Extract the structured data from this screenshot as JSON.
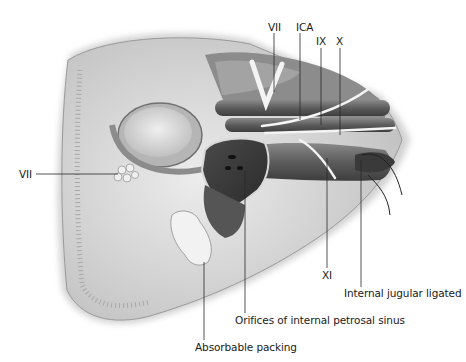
{
  "figure": {
    "type": "anatomical-illustration",
    "labels": [
      {
        "id": "vii_top",
        "text": "VII",
        "x": 268,
        "y": 21
      },
      {
        "id": "ica",
        "text": "ICA",
        "x": 296,
        "y": 21
      },
      {
        "id": "ix",
        "text": "IX",
        "x": 316,
        "y": 35
      },
      {
        "id": "x",
        "text": "X",
        "x": 336,
        "y": 35
      },
      {
        "id": "vii_left",
        "text": "VII",
        "x": 19,
        "y": 168
      },
      {
        "id": "xi",
        "text": "XI",
        "x": 322,
        "y": 269
      },
      {
        "id": "internal_jugular",
        "text": "Internal jugular ligated",
        "x": 344,
        "y": 287
      },
      {
        "id": "orifices",
        "text": "Orifices of internal petrosal sinus",
        "x": 235,
        "y": 314
      },
      {
        "id": "absorbable_packing",
        "text": "Absorbable packing",
        "x": 195,
        "y": 341
      }
    ],
    "colors": {
      "background": "#ffffff",
      "text": "#1a1a1a",
      "leader_line": "#2a2a2a",
      "bone_light": "#e6e6e6",
      "bone_mid": "#c8c8c8",
      "tissue_dark": "#5a5a5a",
      "vessel": "#6e6e6e",
      "nerve": "#f2f2f2"
    }
  }
}
